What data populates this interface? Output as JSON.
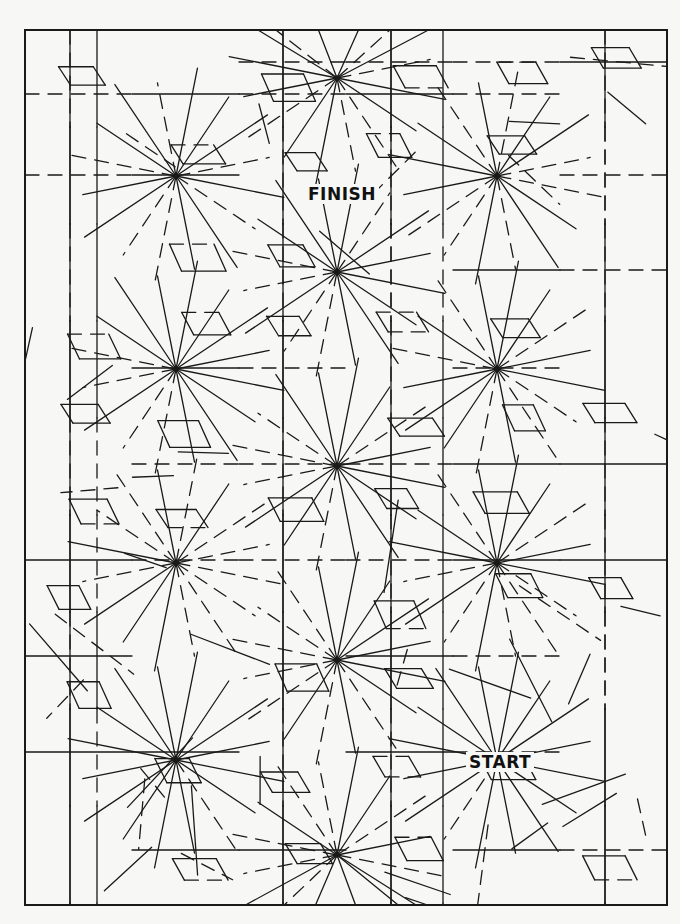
{
  "puzzle": {
    "type": "maze",
    "finish_label": "FINISH",
    "start_label": "START",
    "line_color": "#1a1a1a",
    "background_color": "#f7f7f5",
    "frame": {
      "x1": 25,
      "y1": 30,
      "x2": 667,
      "y2": 905
    },
    "star_centers": [
      [
        337,
        78
      ],
      [
        176,
        176
      ],
      [
        497,
        176
      ],
      [
        337,
        272
      ],
      [
        176,
        369
      ],
      [
        497,
        369
      ],
      [
        337,
        466
      ],
      [
        176,
        563
      ],
      [
        497,
        563
      ],
      [
        337,
        660
      ],
      [
        176,
        760
      ],
      [
        497,
        760
      ],
      [
        337,
        855
      ]
    ],
    "grid_verticals": [
      70,
      97,
      283,
      391,
      443,
      605
    ],
    "grid_horizontals": [
      62,
      94,
      175,
      270,
      368,
      464,
      560,
      656,
      752,
      850
    ]
  }
}
